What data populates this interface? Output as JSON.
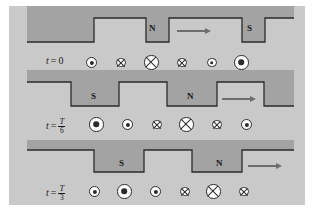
{
  "figure": {
    "background_color": "#c9c9c9",
    "band_color": "#a3a3a3",
    "outline_color": "#2b2b2b",
    "arrow_color": "#6e6e6e",
    "symbol_fill": "#ffffff",
    "width": 296,
    "height": 199
  },
  "panels": [
    {
      "id": "panel-t0",
      "time_label": {
        "variable": "t",
        "equals": "=",
        "value": "0",
        "is_fraction": false,
        "numerator": "",
        "denominator": ""
      },
      "poles": [
        {
          "label": "N",
          "x": 133,
          "y": 27
        },
        {
          "label": "S",
          "x": 231,
          "y": 27
        }
      ],
      "arrow": {
        "x": 168,
        "y": 27,
        "length": 34,
        "direction": "right"
      },
      "wave": {
        "description": "square wave: high from x=85 to x=137, low to x=160, high to x=233, low to x=256, high to right edge",
        "edges": [
          85,
          137,
          160,
          233,
          256
        ]
      },
      "symbols": [
        {
          "type": "dot",
          "size": "medium",
          "x": 83,
          "diameter": 11
        },
        {
          "type": "cross",
          "size": "small",
          "x": 112,
          "diameter": 9.5
        },
        {
          "type": "cross",
          "size": "large",
          "x": 142,
          "diameter": 14.5
        },
        {
          "type": "cross",
          "size": "small",
          "x": 173,
          "diameter": 9.5
        },
        {
          "type": "dot",
          "size": "small",
          "x": 203,
          "diameter": 9.5
        },
        {
          "type": "dot",
          "size": "large",
          "x": 232,
          "diameter": 14.5
        }
      ]
    },
    {
      "id": "panel-t-over-6",
      "time_label": {
        "variable": "t",
        "equals": "=",
        "value": "T/6",
        "is_fraction": true,
        "numerator": "T",
        "denominator": "6"
      },
      "poles": [
        {
          "label": "S",
          "x": 86,
          "y": 27
        },
        {
          "label": "N",
          "x": 182,
          "y": 27
        }
      ],
      "arrow": {
        "x": 215,
        "y": 27,
        "length": 34,
        "direction": "right"
      },
      "wave": {
        "description": "square wave shifted right by one-sixth period",
        "edges": [
          62,
          85,
          110,
          158,
          182,
          208,
          255
        ]
      },
      "symbols": [
        {
          "type": "dot",
          "size": "large",
          "x": 87,
          "diameter": 14.5
        },
        {
          "type": "dot",
          "size": "medium",
          "x": 119,
          "diameter": 11
        },
        {
          "type": "cross",
          "size": "small",
          "x": 148,
          "diameter": 9.5
        },
        {
          "type": "cross",
          "size": "large",
          "x": 177,
          "diameter": 14.5
        },
        {
          "type": "cross",
          "size": "small",
          "x": 208,
          "diameter": 9.5
        },
        {
          "type": "dot",
          "size": "medium",
          "x": 237,
          "diameter": 11
        }
      ]
    },
    {
      "id": "panel-t-over-3",
      "time_label": {
        "variable": "t",
        "equals": "=",
        "value": "T/3",
        "is_fraction": true,
        "numerator": "T",
        "denominator": "3"
      },
      "poles": [
        {
          "label": "S",
          "x": 113,
          "y": 27
        },
        {
          "label": "N",
          "x": 209,
          "y": 27
        }
      ],
      "arrow": {
        "x": 240,
        "y": 27,
        "length": 34,
        "direction": "right"
      },
      "wave": {
        "description": "square wave shifted right by one-third period",
        "edges": [
          85,
          110,
          135,
          183,
          208,
          233
        ]
      },
      "symbols": [
        {
          "type": "dot",
          "size": "medium",
          "x": 86,
          "diameter": 11
        },
        {
          "type": "dot",
          "size": "large",
          "x": 115,
          "diameter": 14.5
        },
        {
          "type": "dot",
          "size": "medium",
          "x": 146,
          "diameter": 11
        },
        {
          "type": "cross",
          "size": "small",
          "x": 176,
          "diameter": 9.5
        },
        {
          "type": "cross",
          "size": "large",
          "x": 204,
          "diameter": 14.5
        },
        {
          "type": "cross",
          "size": "small",
          "x": 235,
          "diameter": 9.5
        }
      ]
    }
  ],
  "legend": {
    "dot_meaning": "current out of page",
    "cross_meaning": "current into page"
  }
}
